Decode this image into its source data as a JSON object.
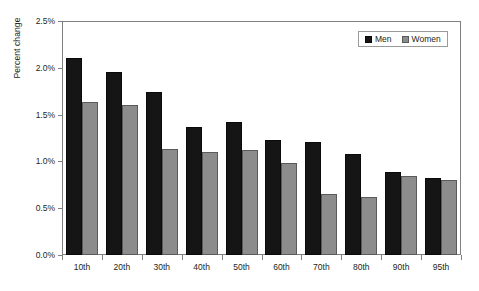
{
  "chart_data": {
    "type": "bar",
    "title": "",
    "xlabel": "",
    "ylabel": "Percent change",
    "categories": [
      "10th",
      "20th",
      "30th",
      "40th",
      "50th",
      "60th",
      "70th",
      "80th",
      "90th",
      "95th"
    ],
    "series": [
      {
        "name": "Men",
        "color": "#151515",
        "values": [
          2.1,
          1.95,
          1.74,
          1.37,
          1.42,
          1.23,
          1.21,
          1.08,
          0.89,
          0.82
        ]
      },
      {
        "name": "Women",
        "color": "#8c8c8c",
        "values": [
          1.64,
          1.6,
          1.13,
          1.1,
          1.12,
          0.98,
          0.65,
          0.62,
          0.84,
          0.8
        ]
      }
    ],
    "ylim": [
      0,
      2.5
    ],
    "ytick_values": [
      0,
      0.5,
      1.0,
      1.5,
      2.0,
      2.5
    ],
    "ytick_labels": [
      "0.0%",
      "0.5%",
      "1.0%",
      "1.5%",
      "2.0%",
      "2.5%"
    ],
    "grid": false,
    "legend_position": "top-right",
    "value_suffix": "%"
  },
  "axis": {
    "y_title": "Percent change"
  },
  "legend": {
    "entries": [
      {
        "label": "Men"
      },
      {
        "label": "Women"
      }
    ]
  },
  "title_remnant": {
    "text": ""
  }
}
